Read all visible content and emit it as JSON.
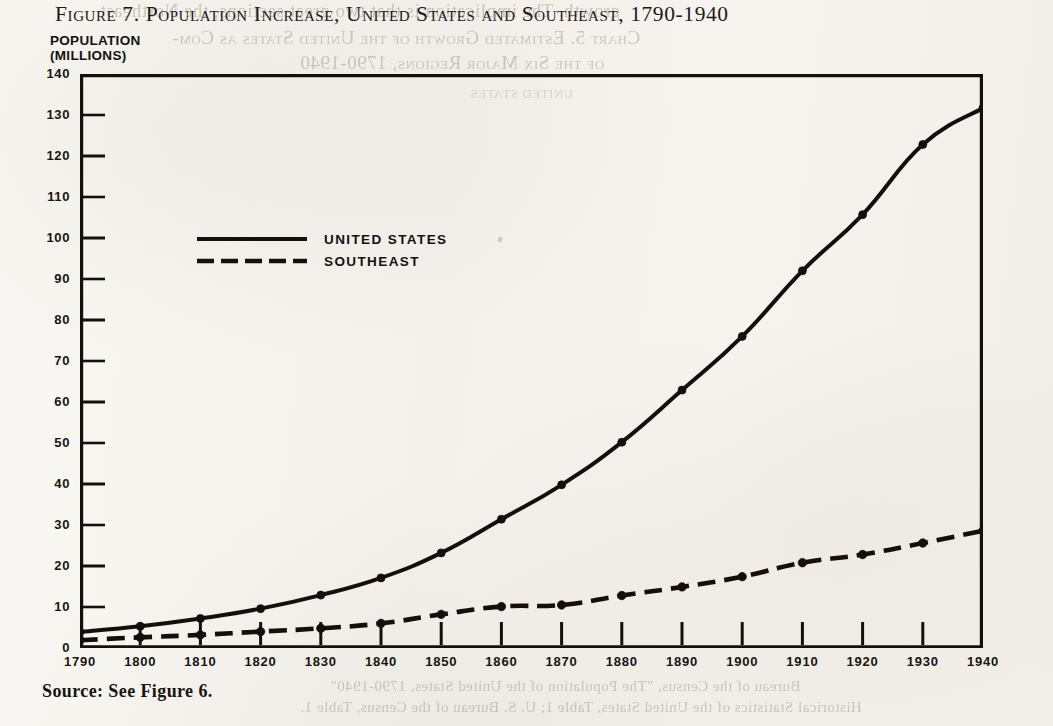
{
  "figure": {
    "title": "Figure 7.  Population Increase, United States and Southeast, 1790-1940",
    "y_axis_unit_label": "POPULATION\n(MILLIONS)",
    "source_note": "Source: See Figure 6."
  },
  "legend": {
    "position": "inside-upper-left",
    "entries": [
      {
        "label": "UNITED STATES",
        "style": "solid"
      },
      {
        "label": "SOUTHEAST",
        "style": "dashed"
      }
    ]
  },
  "page_show_through": {
    "line_1": "growth. The implication is that two great sections, the Northeast",
    "line_2": "Chart 5.  Estimated Growth of the United States as Com-",
    "line_3": "of the Six Major Regions, 1790-1940",
    "line_4": "Bureau of the Census, \"The Population of the United States, 1790-1940\"",
    "line_5": "Historical Statistics of the United States, Table 1; U. S. Bureau of the Census, Table 1.",
    "line_6": "UNITED STATES"
  },
  "chart_data": {
    "type": "line",
    "title": "Figure 7.  Population Increase, United States and Southeast, 1790-1940",
    "xlabel": "",
    "ylabel": "POPULATION (MILLIONS)",
    "xlim": [
      1790,
      1940
    ],
    "ylim": [
      0,
      140
    ],
    "ytick_step": 10,
    "grid": false,
    "markers": "filled-circle",
    "categories": [
      1790,
      1800,
      1810,
      1820,
      1830,
      1840,
      1850,
      1860,
      1870,
      1880,
      1890,
      1900,
      1910,
      1920,
      1930,
      1940
    ],
    "tick_labels_x": [
      "1790",
      "1800",
      "1810",
      "1820",
      "1830",
      "1840",
      "1850",
      "1860",
      "1870",
      "1880",
      "1890",
      "1900",
      "1910",
      "1920",
      "1930",
      "1940"
    ],
    "tick_labels_y": [
      "0",
      "10",
      "20",
      "30",
      "40",
      "50",
      "60",
      "70",
      "80",
      "90",
      "100",
      "110",
      "120",
      "130",
      "140"
    ],
    "series": [
      {
        "name": "UNITED STATES",
        "style": "solid",
        "values": [
          3.9,
          5.3,
          7.2,
          9.6,
          12.9,
          17.1,
          23.2,
          31.4,
          39.8,
          50.2,
          62.9,
          76.0,
          92.0,
          105.7,
          122.8,
          131.7
        ]
      },
      {
        "name": "SOUTHEAST",
        "style": "dashed",
        "values": [
          1.9,
          2.6,
          3.2,
          4.0,
          4.8,
          6.0,
          8.2,
          10.1,
          10.5,
          12.8,
          14.9,
          17.4,
          20.8,
          22.8,
          25.6,
          28.6
        ]
      }
    ]
  }
}
